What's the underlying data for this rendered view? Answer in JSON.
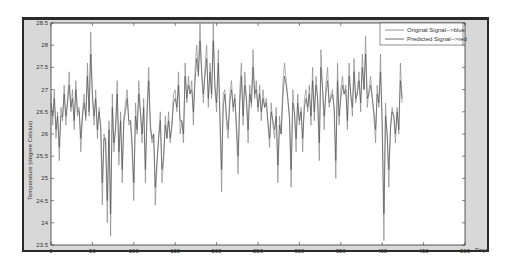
{
  "chart_data": {
    "type": "line",
    "title": "",
    "xlabel": "Days",
    "ylabel": "Temperature (degree Celcius)",
    "xlim": [
      0,
      500
    ],
    "ylim": [
      23.5,
      28.5
    ],
    "xticks": [
      0,
      50,
      100,
      150,
      200,
      250,
      300,
      350,
      400,
      450,
      500
    ],
    "yticks": [
      23.5,
      24,
      24.5,
      25,
      25.5,
      26,
      26.5,
      27,
      27.5,
      28,
      28.5
    ],
    "ytick_labels": [
      "23.5",
      "24",
      "24.5",
      "25",
      "25.5",
      "26",
      "26.5",
      "27",
      "27.5",
      "28",
      "28.5"
    ],
    "xtick_labels": [
      "0",
      "50",
      "100",
      "150",
      "200",
      "250",
      "300",
      "350",
      "400",
      "450",
      "500"
    ],
    "grid": false,
    "legend_position": "upper right",
    "x_step": 2,
    "series": [
      {
        "name": "Original Signal-->blue",
        "color": "#7a7a7a",
        "values": [
          26.9,
          26.2,
          27.0,
          25.9,
          26.5,
          25.4,
          26.6,
          26.3,
          27.1,
          26.2,
          26.8,
          27.4,
          26.5,
          27.0,
          26.1,
          27.2,
          26.4,
          26.6,
          25.6,
          26.5,
          26.9,
          26.3,
          27.6,
          26.4,
          28.3,
          26.8,
          26.2,
          27.0,
          25.9,
          26.6,
          26.1,
          24.4,
          26.0,
          25.8,
          24.0,
          26.3,
          23.7,
          26.9,
          25.6,
          26.2,
          27.2,
          25.3,
          26.5,
          24.9,
          26.4,
          26.7,
          27.0,
          26.2,
          26.3,
          25.6,
          24.5,
          26.7,
          26.0,
          27.2,
          26.5,
          25.8,
          26.8,
          24.9,
          26.6,
          27.5,
          26.1,
          25.8,
          26.0,
          24.4,
          25.3,
          25.9,
          26.5,
          24.9,
          25.4,
          26.4,
          25.9,
          26.5,
          25.8,
          26.2,
          26.9,
          27.0,
          26.5,
          27.4,
          26.0,
          26.3,
          25.8,
          27.6,
          26.7,
          27.3,
          26.9,
          27.2,
          26.2,
          27.5,
          28.0,
          27.4,
          28.5,
          27.3,
          26.7,
          27.5,
          28.0,
          26.6,
          27.6,
          26.8,
          28.5,
          27.0,
          26.5,
          27.9,
          26.3,
          24.7,
          26.9,
          27.0,
          26.2,
          25.9,
          26.9,
          27.2,
          26.5,
          26.9,
          26.0,
          25.1,
          27.0,
          27.6,
          26.2,
          27.4,
          26.8,
          25.8,
          27.1,
          26.6,
          27.9,
          26.8,
          27.2,
          26.5,
          27.1,
          26.3,
          27.0,
          26.6,
          26.8,
          26.2,
          25.7,
          26.7,
          26.2,
          25.9,
          26.6,
          24.9,
          26.4,
          26.0,
          27.1,
          27.6,
          27.2,
          26.8,
          26.3,
          24.8,
          27.0,
          26.5,
          25.6,
          26.9,
          26.2,
          26.6,
          25.6,
          26.8,
          27.0,
          26.5,
          27.1,
          26.2,
          27.5,
          26.3,
          27.3,
          26.8,
          25.4,
          27.9,
          27.0,
          26.1,
          27.1,
          27.5,
          26.6,
          26.9,
          27.0,
          26.5,
          25.0,
          27.6,
          26.2,
          27.0,
          27.3,
          26.9,
          27.1,
          26.1,
          27.6,
          26.9,
          26.4,
          27.7,
          26.7,
          27.0,
          27.4,
          26.5,
          27.8,
          27.0,
          28.2,
          26.6,
          27.0,
          27.3,
          26.8,
          26.4,
          25.8,
          27.1,
          26.6,
          27.8,
          26.1,
          23.6,
          26.7,
          25.9,
          24.8,
          26.2,
          26.6,
          26.4,
          25.8,
          26.6,
          26.0,
          27.6,
          26.7
        ],
        "start_x": 0
      },
      {
        "name": "Predicted Signal-->red",
        "color": "#4a4a4a",
        "values": [
          26.7,
          26.4,
          26.8,
          26.1,
          26.4,
          25.7,
          26.4,
          26.4,
          26.9,
          26.4,
          26.7,
          27.1,
          26.6,
          26.8,
          26.3,
          27.0,
          26.5,
          26.5,
          25.9,
          26.4,
          26.7,
          26.4,
          27.3,
          26.5,
          27.8,
          26.9,
          26.4,
          26.8,
          26.1,
          26.5,
          26.2,
          24.9,
          25.9,
          25.9,
          24.5,
          26.1,
          24.2,
          26.6,
          25.8,
          26.1,
          26.9,
          25.6,
          26.3,
          25.2,
          26.3,
          26.5,
          26.8,
          26.3,
          26.3,
          25.8,
          24.9,
          26.4,
          26.1,
          26.9,
          26.5,
          26.0,
          26.6,
          25.2,
          26.4,
          27.2,
          26.2,
          25.9,
          26.0,
          24.8,
          25.4,
          25.9,
          26.3,
          25.2,
          25.5,
          26.2,
          25.9,
          26.3,
          25.9,
          26.2,
          26.7,
          26.8,
          26.6,
          27.1,
          26.3,
          26.3,
          26.0,
          27.3,
          26.8,
          27.1,
          26.9,
          27.0,
          26.5,
          27.2,
          27.7,
          27.3,
          28.1,
          27.4,
          26.9,
          27.3,
          27.7,
          26.8,
          27.4,
          26.9,
          28.1,
          27.1,
          26.7,
          27.6,
          26.5,
          25.2,
          26.6,
          26.9,
          26.4,
          26.1,
          26.7,
          27.0,
          26.6,
          26.8,
          26.2,
          25.5,
          26.7,
          27.3,
          26.4,
          27.1,
          26.8,
          26.1,
          26.9,
          26.7,
          27.5,
          26.9,
          27.0,
          26.6,
          26.9,
          26.5,
          26.8,
          26.6,
          26.7,
          26.3,
          25.9,
          26.5,
          26.3,
          26.1,
          26.4,
          25.3,
          26.2,
          26.0,
          26.8,
          27.3,
          27.1,
          26.8,
          26.4,
          25.2,
          26.7,
          26.5,
          25.9,
          26.7,
          26.3,
          26.5,
          25.9,
          26.6,
          26.8,
          26.6,
          26.9,
          26.4,
          27.2,
          26.5,
          27.1,
          26.8,
          25.8,
          27.5,
          27.0,
          26.4,
          26.9,
          27.2,
          26.7,
          26.8,
          26.9,
          26.6,
          25.4,
          27.2,
          26.4,
          26.8,
          27.1,
          26.9,
          27.0,
          26.3,
          27.3,
          26.9,
          26.6,
          27.4,
          26.8,
          26.9,
          27.2,
          26.7,
          27.5,
          27.0,
          27.8,
          26.8,
          26.9,
          27.1,
          26.8,
          26.5,
          26.1,
          26.9,
          26.7,
          27.4,
          26.3,
          24.2,
          26.4,
          26.0,
          25.2,
          26.1,
          26.5,
          26.4,
          26.0,
          26.5,
          26.1,
          27.2,
          26.8
        ],
        "start_x": 0
      }
    ]
  },
  "figure": {
    "background": "#d8d8d8",
    "plot_background": "#ffffff"
  }
}
